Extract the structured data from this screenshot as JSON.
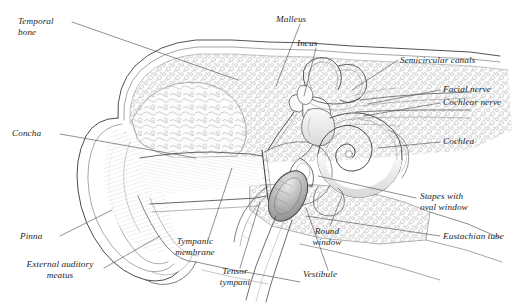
{
  "figure": {
    "type": "anatomical-illustration",
    "style": "pen-and-ink line drawing, grayscale",
    "background_color": "#ffffff",
    "ink_color": "#3a3a3a",
    "label_color": "#221f1f"
  },
  "labels": [
    {
      "id": "temporal-bone",
      "text": "Temporal\nbone",
      "x": 18,
      "y": 16,
      "align": "left"
    },
    {
      "id": "malleus",
      "text": "Malleus",
      "x": 276,
      "y": 14,
      "align": "left"
    },
    {
      "id": "incus",
      "text": "Incus",
      "x": 297,
      "y": 38,
      "align": "left"
    },
    {
      "id": "semicircular-canals",
      "text": "Semicircular canals",
      "x": 400,
      "y": 55,
      "align": "left"
    },
    {
      "id": "facial-nerve",
      "text": "Facial nerve",
      "x": 443,
      "y": 88,
      "align": "left"
    },
    {
      "id": "cochlear-nerve",
      "text": "Cochlear nerve",
      "x": 443,
      "y": 101,
      "align": "left"
    },
    {
      "id": "cochlea",
      "text": "Cochlea",
      "x": 443,
      "y": 139,
      "align": "left"
    },
    {
      "id": "concha",
      "text": "Concha",
      "x": 12,
      "y": 130,
      "align": "left"
    },
    {
      "id": "stapes-with-oval-window",
      "text": "Stapes with\noval window",
      "x": 420,
      "y": 194,
      "align": "left"
    },
    {
      "id": "eustachian-tube",
      "text": "Eustachian tube",
      "x": 443,
      "y": 234,
      "align": "left"
    },
    {
      "id": "pinna",
      "text": "Pinna",
      "x": 20,
      "y": 234,
      "align": "left"
    },
    {
      "id": "external-auditory-meatus",
      "text": "External auditory\nmeatus",
      "x": 10,
      "y": 262,
      "align": "left"
    },
    {
      "id": "tympanic-membrane",
      "text": "Tympanic\nmembrane",
      "x": 167,
      "y": 238,
      "align": "left"
    },
    {
      "id": "tensor-tympani",
      "text": "Tensor\ntympani",
      "x": 214,
      "y": 269,
      "align": "left"
    },
    {
      "id": "round-window",
      "text": "Round\nwindow",
      "x": 307,
      "y": 228,
      "align": "left"
    },
    {
      "id": "vestibule",
      "text": "Vestibule",
      "x": 303,
      "y": 271,
      "align": "left"
    }
  ],
  "structures": [
    "pinna (auricle)",
    "concha",
    "external auditory meatus",
    "tympanic membrane",
    "temporal bone (cancellous, stippled)",
    "malleus",
    "incus",
    "stapes with oval window",
    "tensor tympani muscle",
    "semicircular canals",
    "vestibule",
    "cochlea (spiral)",
    "round window",
    "facial nerve",
    "cochlear nerve",
    "eustachian tube"
  ]
}
